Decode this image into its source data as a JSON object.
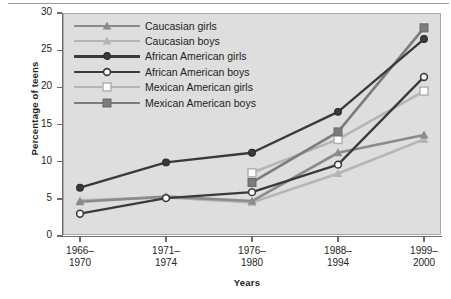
{
  "chart_data": {
    "type": "line",
    "title": "",
    "xlabel": "Years",
    "ylabel": "Percentage of teens",
    "ylim": [
      0,
      30
    ],
    "yticks": [
      0,
      5,
      10,
      15,
      20,
      25,
      30
    ],
    "grid": false,
    "legend_position": "upper-left inside plot",
    "categories": [
      "1966-\n1970",
      "1971-\n1974",
      "1976-\n1980",
      "1988-\n1994",
      "1999-\n2000"
    ],
    "category_lines": [
      [
        "1966–",
        "1970"
      ],
      [
        "1971–",
        "1974"
      ],
      [
        "1976–",
        "1980"
      ],
      [
        "1988–",
        "1994"
      ],
      [
        "1999–",
        "2000"
      ]
    ],
    "series": [
      {
        "name": "Caucasian girls",
        "marker": "triangle-filled",
        "color": "#8b8b8b",
        "values": [
          4.6,
          5.3,
          4.7,
          11.2,
          13.6
        ]
      },
      {
        "name": "Caucasian boys",
        "marker": "triangle-filled",
        "color": "#b5b5b5",
        "values": [
          4.8,
          5.2,
          4.5,
          8.4,
          13.0
        ]
      },
      {
        "name": "African American girls",
        "marker": "circle-filled",
        "color": "#3a3a3a",
        "values": [
          6.5,
          9.9,
          11.2,
          16.7,
          26.5
        ]
      },
      {
        "name": "African American boys",
        "marker": "circle-open",
        "color": "#3a3a3a",
        "values": [
          3.0,
          5.1,
          5.9,
          9.6,
          21.4
        ]
      },
      {
        "name": "Mexican American girls",
        "marker": "square-open",
        "color": "#b5b5b5",
        "values": [
          null,
          null,
          8.5,
          13.0,
          19.5
        ]
      },
      {
        "name": "Mexican American boys",
        "marker": "square-filled",
        "color": "#7c7c7c",
        "values": [
          null,
          null,
          7.2,
          14.0,
          28.0
        ]
      }
    ]
  },
  "axis": {
    "ylabel": "Percentage of teens",
    "xlabel": "Years"
  },
  "colors": {
    "plot_background": "#dedede",
    "plot_border": "#a8a8a8",
    "axis": "#6d6d6d",
    "text": "#231f20",
    "caucasian_girls": "#8b8b8b",
    "caucasian_boys": "#b5b5b5",
    "african_american": "#3a3a3a",
    "mexican_american_girls": "#b5b5b5",
    "mexican_american_boys": "#7c7c7c"
  }
}
